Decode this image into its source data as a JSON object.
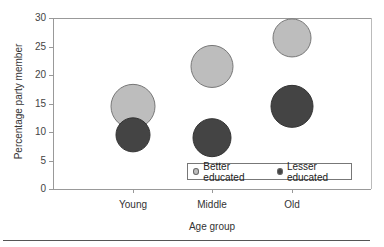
{
  "chart_data": {
    "type": "scatter",
    "subtype": "bubble",
    "title": "",
    "xlabel": "Age group",
    "ylabel": "Percentage party member",
    "categories": [
      "Young",
      "Middle",
      "Old"
    ],
    "ylim": [
      0,
      30
    ],
    "yticks": [
      0,
      5,
      10,
      15,
      20,
      25,
      30
    ],
    "grid": false,
    "legend_position": "inside lower right",
    "series": [
      {
        "name": "Better educated",
        "color": "#bdbdbd",
        "values": [
          14.5,
          21.5,
          26.5
        ],
        "bubble_radius_px": [
          22,
          21,
          19
        ]
      },
      {
        "name": "Lesser educated",
        "color": "#444444",
        "values": [
          9.5,
          9.0,
          14.5
        ],
        "bubble_radius_px": [
          17,
          19,
          21
        ]
      }
    ]
  },
  "legend": {
    "items": [
      {
        "label": "Better educated",
        "color": "#bdbdbd"
      },
      {
        "label": "Lesser educated",
        "color": "#444444"
      }
    ]
  }
}
